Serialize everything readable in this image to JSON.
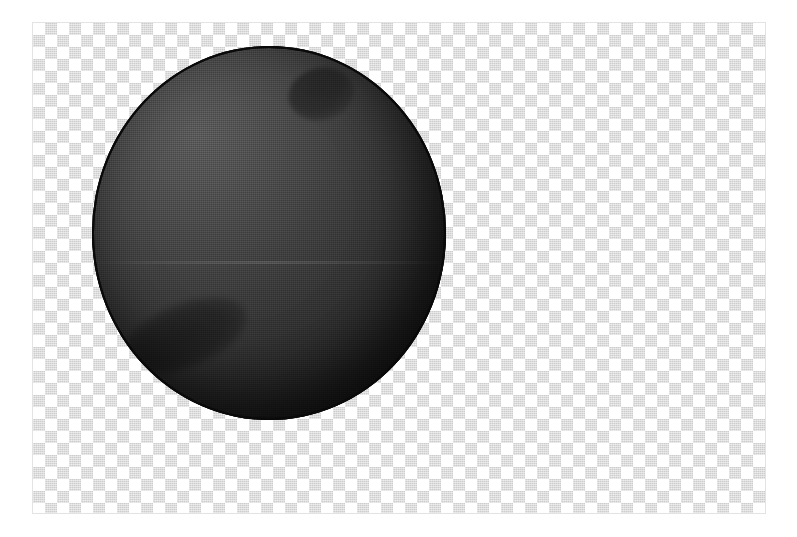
{
  "canvas": {
    "name": "transparency-canvas",
    "background_mode": "transparent-checkerboard",
    "checker_square_px": "12",
    "checker_light_color": "#ffffff",
    "checker_dark_color": "#c9c9c9",
    "border_color": "#e3e3e3",
    "x": "32",
    "y": "22",
    "width": "734",
    "height": "492"
  },
  "artwork": {
    "name": "shaded-sphere",
    "description": "Dark dithered sphere rendered on a transparent background",
    "shape": "sphere",
    "x": "92",
    "y": "46",
    "width": "354",
    "height": "374",
    "outline_color": "#0a0a0a",
    "highlight_color": "#5a5a5a",
    "shadow_color": "#121212",
    "light_direction": "upper-left",
    "texture": "halftone-dither",
    "features": [
      {
        "name": "crater-upper-right",
        "shape": "circular",
        "x": "288",
        "y": "68",
        "width": "66",
        "height": "52"
      },
      {
        "name": "crater-lower-left",
        "shape": "elongated",
        "x": "118",
        "y": "304",
        "width": "132",
        "height": "64"
      }
    ]
  }
}
